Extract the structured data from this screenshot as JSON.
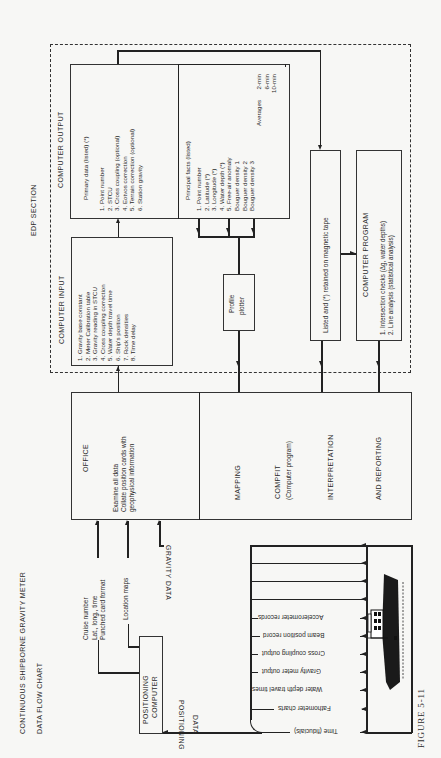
{
  "figure": {
    "title_line1": "CONTINUOUS SHIPBORNE GRAVITY METER",
    "title_line2": "DATA FLOW CHART",
    "label": "FIGURE 5-11"
  },
  "edp_section": {
    "label": "EDP SECTION",
    "computer_output": {
      "heading": "COMPUTER OUTPUT",
      "primary": {
        "heading": "Primary data (listed) (*)",
        "items": [
          "1.  Point number",
          "2.  STCU",
          "3.  Cross coupling (optional)",
          "4.  Eotvos correction",
          "5.  Terrain correction (optional)",
          "6.  Station gravity"
        ]
      },
      "principal": {
        "heading": "Principal facts (listed)",
        "items": [
          "1.  Point number",
          "2.  Latitude (*)",
          "3.  Longitude (*)",
          "4.  Water depth (*)",
          "5.  Free-air anomaly",
          "     Bouguer density 1",
          "     Bouguer density 2",
          "     Bouguer density 3"
        ],
        "averages_label": "Averages",
        "averages": [
          "2-min",
          "6-min",
          "10-min"
        ]
      }
    },
    "computer_input": {
      "heading": "COMPUTER INPUT",
      "items": [
        "1.  Gravity base constant",
        "2.  Meter Calibration table",
        "3.  Gravity reading in STCU",
        "4.  Cross coupling correction",
        "5.  Water depth travel time",
        "6.  Ship's position",
        "7.  Rock densities",
        "8.  Time delay"
      ]
    },
    "profile_plotter": {
      "line1": "Profile",
      "line2": "plotter"
    },
    "magnetic_tape": {
      "label": "Listed and (*) retained on magnetic tape"
    },
    "computer_program": {
      "heading": "COMPUTER PROGRAM",
      "items": [
        "1.  Intersection checks (Δg, water depths)",
        "2.  Line analysis (statistical analysis)"
      ]
    }
  },
  "office": {
    "heading": "OFFICE",
    "lines": [
      "Examine all data",
      "Collate position cards with",
      "geophysical information"
    ],
    "mapping": "MAPPING",
    "compfit": "COMPFIT",
    "compfit_sub": "(Computer program)",
    "interpretation": "INTERPRETATION",
    "reporting": "AND REPORTING"
  },
  "positioning": {
    "computer_line1": "POSITIONING",
    "computer_line2": "COMPUTER",
    "inputs": [
      "Cruise number",
      "Lat., long., time",
      "Punched card format",
      "Location maps"
    ],
    "data_label_1": "POSITIONING",
    "data_label_2": "DATA"
  },
  "ship": {
    "gravity_data_label": "GRAVITY DATA",
    "records": [
      "Time (fiducials)",
      "Fathometer charts",
      "Water depth travel times",
      "Gravity meter output",
      "Cross coupling output",
      "Beam position record",
      "Accelerometer records"
    ]
  }
}
